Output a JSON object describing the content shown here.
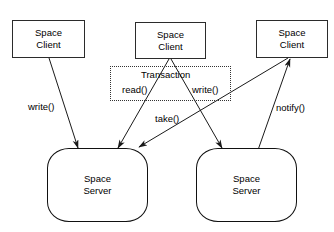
{
  "diagram": {
    "title": "",
    "type": "space-client-server-transaction-diagram",
    "colors": {
      "background": "#ffffff",
      "stroke": "#1a1a1a",
      "client_border": "#2b2b2b",
      "server_border": "#111111",
      "transaction_border": "#333333",
      "text": "#000000"
    }
  },
  "clients": [
    {
      "id": "client-1",
      "line1": "Space",
      "line2": "Client"
    },
    {
      "id": "client-2",
      "line1": "Space",
      "line2": "Client"
    },
    {
      "id": "client-3",
      "line1": "Space",
      "line2": "Client"
    }
  ],
  "servers": [
    {
      "id": "server-1",
      "line1": "Space",
      "line2": "Server"
    },
    {
      "id": "server-2",
      "line1": "Space",
      "line2": "Server"
    }
  ],
  "transaction": {
    "title": "Transaction",
    "operations": [
      {
        "id": "tx-read",
        "label": "read()"
      },
      {
        "id": "tx-write",
        "label": "write()"
      }
    ]
  },
  "edges": [
    {
      "id": "edge-write-c1-s1",
      "label": "write()",
      "from": "client-1",
      "to": "server-1",
      "direction": "down"
    },
    {
      "id": "edge-read-c2-s1",
      "label": "read()",
      "from": "client-2",
      "to": "server-1",
      "direction": "down"
    },
    {
      "id": "edge-write-c2-s2",
      "label": "write()",
      "from": "client-2",
      "to": "server-2",
      "direction": "down"
    },
    {
      "id": "edge-take-c3-s1",
      "label": "take()",
      "from": "client-3",
      "to": "server-1",
      "direction": "down-left"
    },
    {
      "id": "edge-notify-s2-c3",
      "label": "notify()",
      "from": "server-2",
      "to": "client-3",
      "direction": "up-right"
    }
  ]
}
